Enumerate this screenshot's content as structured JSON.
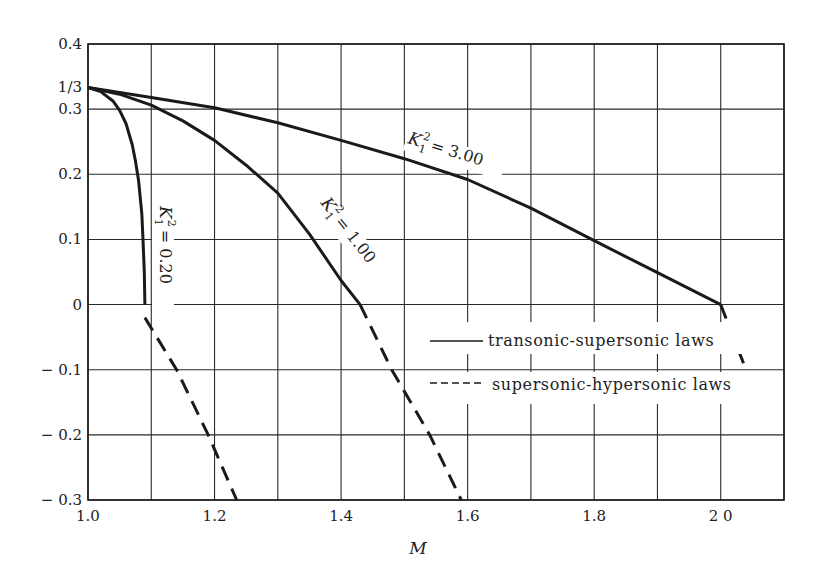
{
  "chart_data": {
    "type": "line",
    "title": "",
    "xlabel": "M",
    "ylabel": "",
    "xlim": [
      1.0,
      2.1
    ],
    "ylim": [
      -0.3,
      0.4
    ],
    "grid": true,
    "x_ticks": [
      1.0,
      1.1,
      1.2,
      1.3,
      1.4,
      1.5,
      1.6,
      1.7,
      1.8,
      1.9,
      2.0,
      2.1
    ],
    "x_tick_labels": [
      {
        "value": 1.0,
        "label": "1.0"
      },
      {
        "value": 1.2,
        "label": "1.2"
      },
      {
        "value": 1.4,
        "label": "1.4"
      },
      {
        "value": 1.6,
        "label": "1.6"
      },
      {
        "value": 1.8,
        "label": "1.8"
      },
      {
        "value": 2.0,
        "label": "2 0"
      }
    ],
    "y_ticks": [
      -0.3,
      -0.2,
      -0.1,
      0,
      0.1,
      0.2,
      0.3,
      0.4
    ],
    "y_tick_labels": [
      {
        "value": 0.4,
        "label": "0.4"
      },
      {
        "value": 0.3333,
        "label": "1/3"
      },
      {
        "value": 0.3,
        "label": "0.3"
      },
      {
        "value": 0.2,
        "label": "0.2"
      },
      {
        "value": 0.1,
        "label": "0.1"
      },
      {
        "value": 0,
        "label": "0"
      },
      {
        "value": -0.1,
        "label": "− 0.1"
      },
      {
        "value": -0.2,
        "label": "− 0.2"
      },
      {
        "value": -0.3,
        "label": "− 0.3"
      }
    ],
    "legend": {
      "position": "lower right (inside plot)",
      "entries": [
        {
          "style": "solid",
          "label": "transonic-supersonic laws"
        },
        {
          "style": "dashed",
          "label": "supersonic-hypersonic laws"
        }
      ]
    },
    "series": [
      {
        "name": "K1^2 = 0.20",
        "label": "K₁² = 0.20",
        "style": "solid",
        "x": [
          1.0,
          1.02,
          1.04,
          1.05,
          1.06,
          1.07,
          1.075,
          1.08,
          1.085,
          1.087,
          1.089,
          1.09
        ],
        "y": [
          0.3333,
          0.327,
          0.312,
          0.298,
          0.278,
          0.245,
          0.22,
          0.19,
          0.14,
          0.1,
          0.05,
          0.0
        ]
      },
      {
        "name": "K1^2 = 0.20 (hypersonic)",
        "style": "dashed",
        "x": [
          1.09,
          1.14,
          1.19,
          1.235
        ],
        "y": [
          -0.02,
          -0.1,
          -0.2,
          -0.3
        ]
      },
      {
        "name": "K1^2 = 1.00",
        "label": "K₁² = 1.00",
        "style": "solid",
        "x": [
          1.0,
          1.05,
          1.1,
          1.15,
          1.2,
          1.25,
          1.3,
          1.35,
          1.4,
          1.43
        ],
        "y": [
          0.3333,
          0.323,
          0.306,
          0.282,
          0.252,
          0.214,
          0.171,
          0.108,
          0.037,
          0.0
        ]
      },
      {
        "name": "K1^2 = 1.00 (hypersonic)",
        "style": "dashed",
        "x": [
          1.43,
          1.48,
          1.54,
          1.59
        ],
        "y": [
          0.0,
          -0.1,
          -0.2,
          -0.3
        ]
      },
      {
        "name": "K1^2 = 3.00",
        "label": "K₁² = 3.00",
        "style": "solid",
        "x": [
          1.0,
          1.1,
          1.2,
          1.3,
          1.4,
          1.5,
          1.6,
          1.7,
          1.8,
          1.9,
          2.0
        ],
        "y": [
          0.3333,
          0.318,
          0.302,
          0.279,
          0.252,
          0.224,
          0.192,
          0.148,
          0.098,
          0.049,
          0.0
        ]
      },
      {
        "name": "K1^2 = 3.00 (hypersonic)",
        "style": "dashed",
        "x": [
          2.0,
          2.04
        ],
        "y": [
          0.0,
          -0.1
        ]
      }
    ],
    "annotations": [
      {
        "text": "K₁² = 0.20",
        "x": 1.11,
        "y": 0.05,
        "rotation": 90
      },
      {
        "text": "K₁² = 1.00",
        "x": 1.37,
        "y": 0.1,
        "rotation": 52
      },
      {
        "text": "K₁² = 3.00",
        "x": 1.65,
        "y": 0.22,
        "rotation": 17
      }
    ]
  },
  "labels": {
    "x_axis_title": "M",
    "legend_solid": "transonic-supersonic laws",
    "legend_dashed": "supersonic-hypersonic laws",
    "curve_k": "K",
    "curve_sub": "1",
    "curve_sup": "2",
    "curve_020": "= 0.20",
    "curve_100": "= 1.00",
    "curve_300": "= 3.00"
  },
  "style": {
    "ink": "#1a1a1a",
    "grid": "#2a2a2a",
    "background": "#ffffff"
  }
}
